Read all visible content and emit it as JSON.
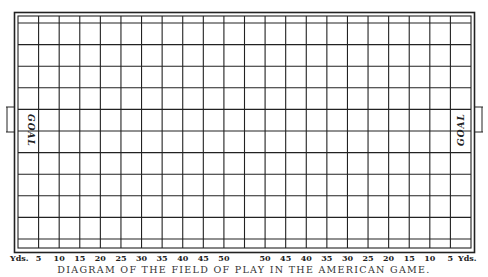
{
  "diagram": {
    "caption": "DIAGRAM OF THE FIELD OF PLAY IN THE AMERICAN GAME.",
    "unit_label_left": "Yds.",
    "unit_label_right": "Yds.",
    "yard_labels": [
      "5",
      "10",
      "15",
      "20",
      "25",
      "30",
      "35",
      "40",
      "45",
      "50",
      "50",
      "45",
      "40",
      "35",
      "30",
      "25",
      "20",
      "15",
      "10",
      "5"
    ],
    "goal_left_label": "GOAL",
    "goal_right_label": "GOAL",
    "grid": {
      "columns": 22,
      "rows": 10,
      "has_end_strips": true,
      "line_color": "#222222",
      "background": "#ffffff"
    }
  }
}
